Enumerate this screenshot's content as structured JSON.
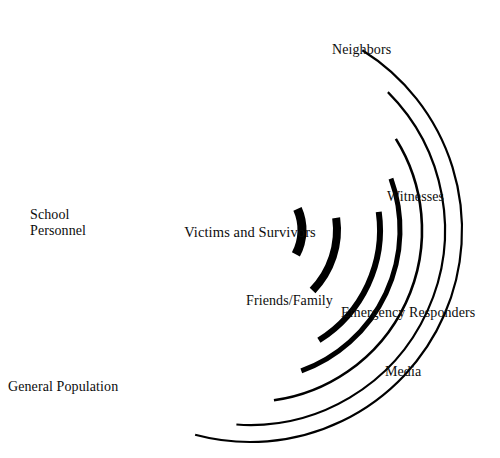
{
  "figure": {
    "type": "concentric-ring-diagram",
    "background_color": "#ffffff",
    "stroke_color": "#000000",
    "center": {
      "x": 250,
      "y": 230
    }
  },
  "center_label": "Victims and Survivors",
  "rings": [
    {
      "index": 1,
      "label": "Friends/Family",
      "radius": 52,
      "stroke_width": 9,
      "gap_start_deg": 20,
      "gap_end_deg": 72
    },
    {
      "index": 2,
      "label": "Emergency Responders",
      "radius": 87,
      "stroke_width": 8,
      "gap_start_deg": 2,
      "gap_end_deg": 46
    },
    {
      "index": 3,
      "label": "Witnesses",
      "radius": 130,
      "stroke_width": 6,
      "gap_start_deg": -18,
      "gap_end_deg": 24
    },
    {
      "index": 4,
      "label": "Neighbors",
      "radius": 172,
      "stroke_width": 3,
      "gap_start_deg": -42,
      "gap_end_deg": 6
    },
    {
      "index": 5,
      "label": "Media",
      "radius": 195,
      "stroke_width": 2,
      "gap_start_deg": -58,
      "gap_end_deg": -10
    }
  ],
  "labels": {
    "center": "Victims and Survivors",
    "friends_family": "Friends/Family",
    "emergency_responders": "Emergency Responders",
    "media": "Media",
    "witnesses": "Witnesses",
    "neighbors": "Neighbors",
    "school_personnel": "School\nPersonnel",
    "school_personnel_line1": "School",
    "school_personnel_line2": "Personnel",
    "general_population": "General Population"
  },
  "chart_data": {
    "type": "diagram",
    "center": "Victims and Survivors",
    "layers": [
      {
        "order": 1,
        "name": "Friends/Family",
        "radius_px": 52,
        "stroke_px": 9
      },
      {
        "order": 2,
        "name": "Emergency Responders",
        "radius_px": 87,
        "stroke_px": 8
      },
      {
        "order": 3,
        "name": "Witnesses",
        "radius_px": 130,
        "stroke_px": 6
      },
      {
        "order": 4,
        "name": "School Personnel",
        "radius_px": 150,
        "stroke_px": 5
      },
      {
        "order": 5,
        "name": "Neighbors",
        "radius_px": 172,
        "stroke_px": 3
      },
      {
        "order": 6,
        "name": "Media",
        "radius_px": 195,
        "stroke_px": 2
      },
      {
        "order": 7,
        "name": "General Population",
        "radius_px": 212,
        "stroke_px": 2
      }
    ],
    "legend_position": "none",
    "grid": false
  }
}
